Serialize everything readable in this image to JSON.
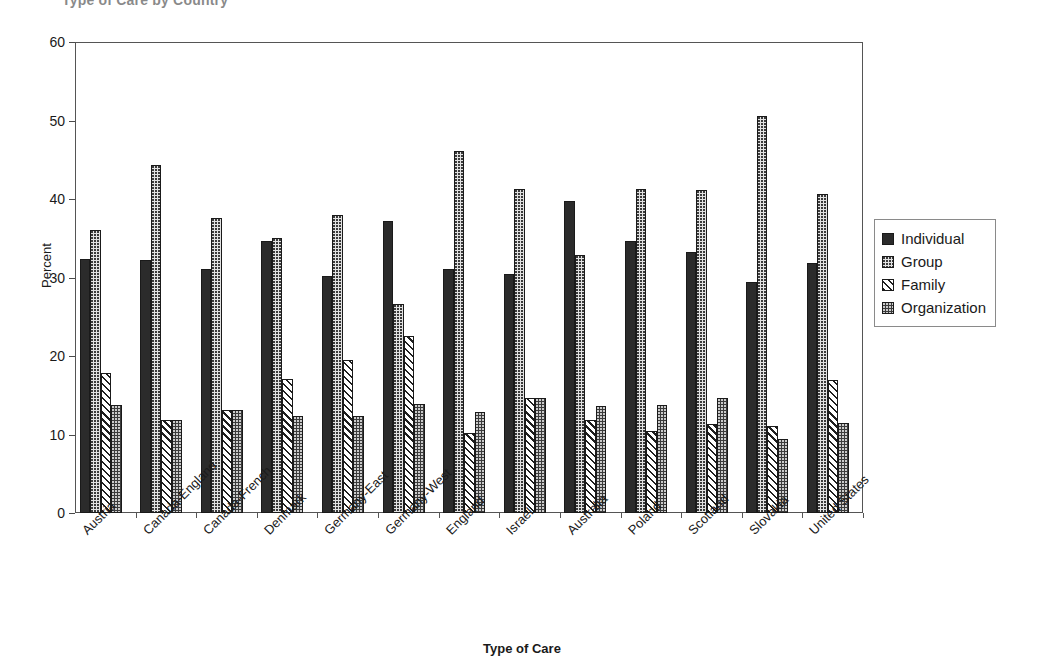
{
  "chart_data": {
    "type": "bar",
    "title": "Type of Care by Country",
    "xlabel": "Type of Care",
    "ylabel": "Percent",
    "ylim": [
      0,
      60
    ],
    "yticks": [
      0,
      10,
      20,
      30,
      40,
      50,
      60
    ],
    "grid": true,
    "legend_position": "right",
    "categories": [
      "Austria",
      "Canada-England",
      "Canada-French",
      "Denmark",
      "Germany-East",
      "Germany-West",
      "England",
      "Israel",
      "Australia",
      "Poland",
      "Scotland",
      "Slovakia",
      "United States"
    ],
    "series": [
      {
        "name": "Individual",
        "pattern": "solid-black",
        "values": [
          32.3,
          32.2,
          31.1,
          34.6,
          30.2,
          37.2,
          31.1,
          30.5,
          39.8,
          34.7,
          33.2,
          29.4,
          31.9
        ]
      },
      {
        "name": "Group",
        "pattern": "light-stipple",
        "values": [
          36.0,
          44.3,
          37.6,
          35.0,
          38.0,
          26.6,
          46.1,
          41.3,
          32.9,
          41.3,
          41.2,
          50.6,
          40.6
        ]
      },
      {
        "name": "Family",
        "pattern": "diagonal-hatch",
        "values": [
          17.9,
          11.8,
          13.1,
          17.1,
          19.5,
          22.5,
          10.2,
          14.6,
          11.9,
          10.4,
          11.3,
          11.1,
          16.9
        ]
      },
      {
        "name": "Organization",
        "pattern": "dark-stipple",
        "values": [
          13.7,
          11.8,
          13.1,
          12.4,
          12.3,
          13.9,
          12.9,
          14.6,
          13.6,
          13.7,
          14.7,
          9.4,
          11.5
        ]
      }
    ]
  },
  "legend": {
    "items": [
      {
        "label": "Individual"
      },
      {
        "label": "Group"
      },
      {
        "label": "Family"
      },
      {
        "label": "Organization"
      }
    ]
  }
}
